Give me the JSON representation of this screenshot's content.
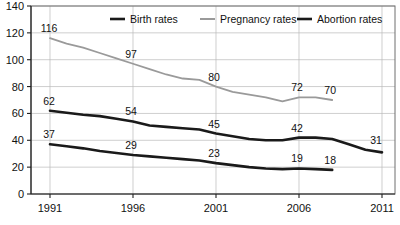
{
  "chart_data": {
    "type": "line",
    "title": "",
    "subtitle": "",
    "xlabel": "",
    "ylabel": "",
    "xlim": [
      1991,
      2011
    ],
    "ylim": [
      0,
      140
    ],
    "grid": true,
    "legend_position": "top",
    "y_ticks": [
      0,
      20,
      40,
      60,
      80,
      100,
      120,
      140
    ],
    "x_ticks": [
      1991,
      1996,
      2001,
      2006,
      2011
    ],
    "colors": {
      "birth": "#1a1a1a",
      "pregnancy": "#9a9a9a",
      "abortion": "#1a1a1a",
      "gridline": "#b9b9b9",
      "axis": "#222222",
      "background": "#ffffff",
      "text": "#111111"
    },
    "series": [
      {
        "name": "Birth rates",
        "color": "#1a1a1a",
        "x": [
          1991,
          1992,
          1993,
          1994,
          1995,
          1996,
          1997,
          1998,
          1999,
          2000,
          2001,
          2002,
          2003,
          2004,
          2005,
          2006,
          2007,
          2008,
          2009,
          2010,
          2011
        ],
        "values": [
          62,
          60.5,
          59,
          58,
          56,
          54,
          51,
          50,
          49,
          48,
          45,
          43,
          41,
          40,
          40,
          42,
          42,
          41,
          37,
          33,
          31
        ],
        "labels": [
          {
            "x": 1991,
            "value": 62
          },
          {
            "x": 1996,
            "value": 54
          },
          {
            "x": 2001,
            "value": 45
          },
          {
            "x": 2006,
            "value": 42
          },
          {
            "x": 2011,
            "value": 31
          }
        ]
      },
      {
        "name": "Pregnancy rates",
        "color": "#9a9a9a",
        "x": [
          1991,
          1992,
          1993,
          1994,
          1995,
          1996,
          1997,
          1998,
          1999,
          2000,
          2001,
          2002,
          2003,
          2004,
          2005,
          2006,
          2007,
          2008
        ],
        "values": [
          116,
          112,
          109,
          105,
          101,
          97,
          93,
          89,
          86,
          85,
          80,
          76,
          74,
          72,
          69,
          72,
          72,
          70
        ],
        "labels": [
          {
            "x": 1991,
            "value": 116
          },
          {
            "x": 1996,
            "value": 97
          },
          {
            "x": 2001,
            "value": 80
          },
          {
            "x": 2006,
            "value": 72
          },
          {
            "x": 2008,
            "value": 70
          }
        ]
      },
      {
        "name": "Abortion rates",
        "color": "#1a1a1a",
        "x": [
          1991,
          1992,
          1993,
          1994,
          1995,
          1996,
          1997,
          1998,
          1999,
          2000,
          2001,
          2002,
          2003,
          2004,
          2005,
          2006,
          2007,
          2008
        ],
        "values": [
          37,
          35.5,
          34,
          32,
          30.5,
          29,
          28,
          27,
          26,
          25,
          23,
          21.5,
          20,
          19,
          18.5,
          19,
          18.5,
          18
        ],
        "labels": [
          {
            "x": 1991,
            "value": 37
          },
          {
            "x": 1996,
            "value": 29
          },
          {
            "x": 2001,
            "value": 23
          },
          {
            "x": 2006,
            "value": 19
          },
          {
            "x": 2008,
            "value": 18
          }
        ]
      }
    ],
    "legend": [
      {
        "label": "Birth rates",
        "color": "#1a1a1a",
        "width": 2.6
      },
      {
        "label": "Pregnancy rates",
        "color": "#9a9a9a",
        "width": 2.0
      },
      {
        "label": "Abortion rates",
        "color": "#1a1a1a",
        "width": 2.6
      }
    ]
  }
}
